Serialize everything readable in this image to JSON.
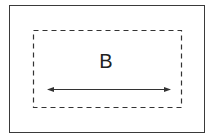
{
  "diagram": {
    "label": "B",
    "outer_border_color": "#3a3a3a",
    "dashed_border_color": "#333333",
    "arrow_color": "#333333",
    "arrow": {
      "direction": "double-headed-horizontal"
    }
  }
}
